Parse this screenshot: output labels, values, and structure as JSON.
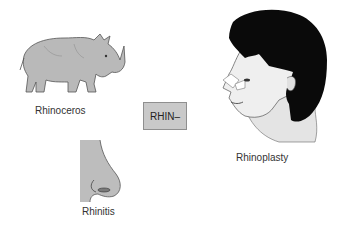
{
  "diagram": {
    "root": {
      "label": "RHIN–",
      "fill": "#c9c9c9",
      "border": "#8f8f8f"
    },
    "terms": [
      {
        "label": "Rhinoceros",
        "image": "rhinoceros-illustration"
      },
      {
        "label": "Rhinitis",
        "image": "nose-illustration"
      },
      {
        "label": "Rhinoplasty",
        "image": "head-profile-bandaged-nose-illustration"
      }
    ]
  }
}
